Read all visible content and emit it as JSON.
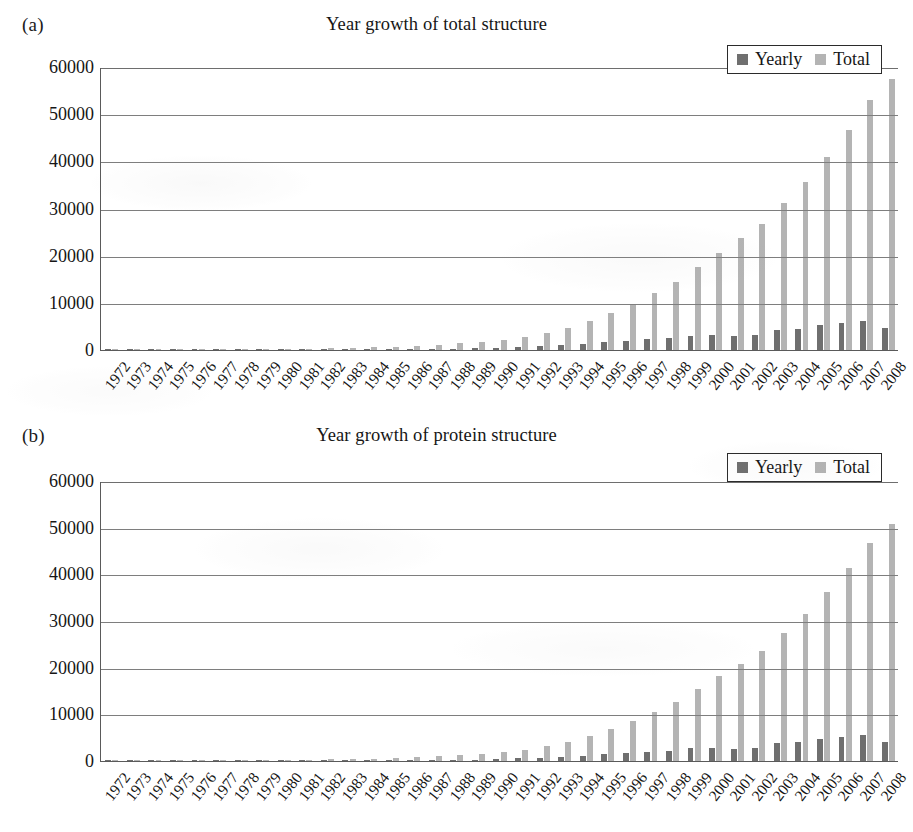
{
  "figure": {
    "background": "#ffffff",
    "colors": {
      "yearly": "#6f6f6f",
      "total": "#b4b4b4",
      "axis": "#5a5a5a",
      "gridline": "#7e7e7e",
      "text": "#161616"
    }
  },
  "panels": [
    {
      "tag": "(a)",
      "title": "Year growth of total structure",
      "legend": [
        {
          "label": "Yearly",
          "color": "#6f6f6f"
        },
        {
          "label": "Total",
          "color": "#b4b4b4"
        }
      ]
    },
    {
      "tag": "(b)",
      "title": "Year growth of protein structure",
      "legend": [
        {
          "label": "Yearly",
          "color": "#6f6f6f"
        },
        {
          "label": "Total",
          "color": "#b4b4b4"
        }
      ]
    }
  ],
  "chart_data": [
    {
      "type": "bar",
      "title": "Year growth of total structure",
      "panel": "(a)",
      "xlabel": "",
      "ylabel": "",
      "ylim": [
        0,
        60000
      ],
      "yticks": [
        0,
        10000,
        20000,
        30000,
        40000,
        50000,
        60000
      ],
      "ytick_labels": [
        "0",
        "10000",
        "20000",
        "30000",
        "40000",
        "50000",
        "60000"
      ],
      "grid": true,
      "legend_position": "top-right",
      "categories": [
        "1972",
        "1973",
        "1974",
        "1975",
        "1976",
        "1977",
        "1978",
        "1979",
        "1980",
        "1981",
        "1982",
        "1983",
        "1984",
        "1985",
        "1986",
        "1987",
        "1988",
        "1989",
        "1990",
        "1991",
        "1992",
        "1993",
        "1994",
        "1995",
        "1996",
        "1997",
        "1998",
        "1999",
        "2000",
        "2001",
        "2002",
        "2003",
        "2004",
        "2005",
        "2006",
        "2007",
        "2008"
      ],
      "series": [
        {
          "name": "Yearly",
          "color": "#6f6f6f",
          "values": [
            8,
            6,
            15,
            13,
            24,
            24,
            30,
            46,
            61,
            70,
            85,
            102,
            115,
            140,
            190,
            216,
            246,
            325,
            410,
            630,
            850,
            1100,
            1350,
            1700,
            2000,
            2250,
            2500,
            3050,
            3100,
            3000,
            3150,
            4300,
            4500,
            5350,
            5750,
            6200,
            4600
          ]
        },
        {
          "name": "Total",
          "color": "#b4b4b4",
          "values": [
            8,
            14,
            29,
            42,
            66,
            90,
            120,
            166,
            227,
            297,
            382,
            484,
            599,
            739,
            929,
            1145,
            1391,
            1716,
            2126,
            2756,
            3606,
            4706,
            6056,
            7756,
            9756,
            12006,
            14506,
            17556,
            20656,
            23656,
            26806,
            31106,
            35606,
            40956,
            46706,
            52906,
            57506
          ]
        }
      ]
    },
    {
      "type": "bar",
      "title": "Year growth of protein structure",
      "panel": "(b)",
      "xlabel": "",
      "ylabel": "",
      "ylim": [
        0,
        60000
      ],
      "yticks": [
        0,
        10000,
        20000,
        30000,
        40000,
        50000,
        60000
      ],
      "ytick_labels": [
        "0",
        "10000",
        "20000",
        "30000",
        "40000",
        "50000",
        "60000"
      ],
      "grid": true,
      "legend_position": "top-right",
      "categories": [
        "1972",
        "1973",
        "1974",
        "1975",
        "1976",
        "1977",
        "1978",
        "1979",
        "1980",
        "1981",
        "1982",
        "1983",
        "1984",
        "1985",
        "1986",
        "1987",
        "1988",
        "1989",
        "1990",
        "1991",
        "1992",
        "1993",
        "1994",
        "1995",
        "1996",
        "1997",
        "1998",
        "1999",
        "2000",
        "2001",
        "2002",
        "2003",
        "2004",
        "2005",
        "2006",
        "2007",
        "2008"
      ],
      "series": [
        {
          "name": "Yearly",
          "color": "#6f6f6f",
          "values": [
            7,
            5,
            13,
            11,
            20,
            21,
            26,
            40,
            53,
            60,
            74,
            90,
            100,
            122,
            165,
            190,
            215,
            285,
            360,
            555,
            750,
            960,
            1180,
            1500,
            1760,
            1980,
            2200,
            2700,
            2750,
            2650,
            2800,
            3800,
            4000,
            4750,
            5100,
            5500,
            4100
          ]
        },
        {
          "name": "Total",
          "color": "#b4b4b4",
          "values": [
            7,
            12,
            25,
            36,
            56,
            77,
            103,
            143,
            196,
            256,
            330,
            420,
            520,
            642,
            807,
            997,
            1212,
            1497,
            1857,
            2412,
            3162,
            4122,
            5302,
            6802,
            8562,
            10542,
            12742,
            15442,
            18192,
            20842,
            23642,
            27442,
            31442,
            36192,
            41292,
            46792,
            50892
          ]
        }
      ]
    }
  ]
}
